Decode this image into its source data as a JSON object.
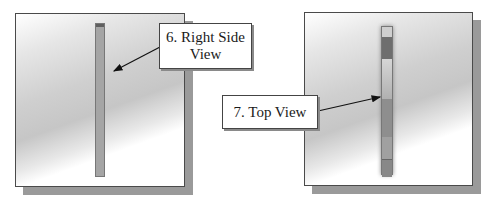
{
  "panels": [
    {
      "name": "right-side-view-panel",
      "callout": {
        "line1": "6. Right Side",
        "line2": "View"
      }
    },
    {
      "name": "top-view-panel",
      "callout": {
        "label": "7. Top View"
      }
    }
  ],
  "colors": {
    "panel_border": "#4a4a4a",
    "shadow": "#9a9a9a",
    "bar_fill": "#a8a8a8",
    "bar_dark": "#6e6e6e",
    "bar_light": "#d4d4d4"
  }
}
